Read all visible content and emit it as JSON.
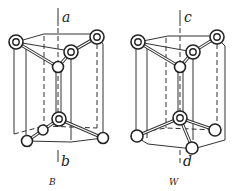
{
  "figures": [
    {
      "id": "B",
      "caption": "B",
      "axis_top_label": "a",
      "axis_bottom_label": "b"
    },
    {
      "id": "W",
      "caption": "W",
      "axis_top_label": "c",
      "axis_bottom_label": "d"
    }
  ],
  "colors": {
    "line": "#333333",
    "background": "#ffffff"
  }
}
